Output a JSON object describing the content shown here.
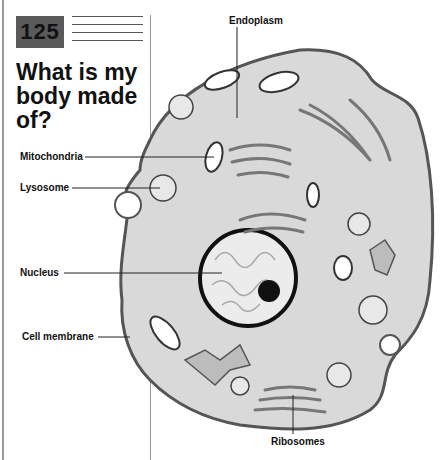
{
  "header": {
    "page_number": "125",
    "title": "What is my body made of?"
  },
  "diagram": {
    "labels": {
      "endoplasm": "Endoplasm",
      "mitochondria": "Mitochondria",
      "lysosome": "Lysosome",
      "nucleus": "Nucleus",
      "cell_membrane": "Cell membrane",
      "ribosomes": "Ribosomes"
    },
    "colors": {
      "cytoplasm": "#d9d9d9",
      "membrane": "#555555",
      "page_number_box": "#5a5a5a",
      "nucleolus": "#111111"
    }
  }
}
